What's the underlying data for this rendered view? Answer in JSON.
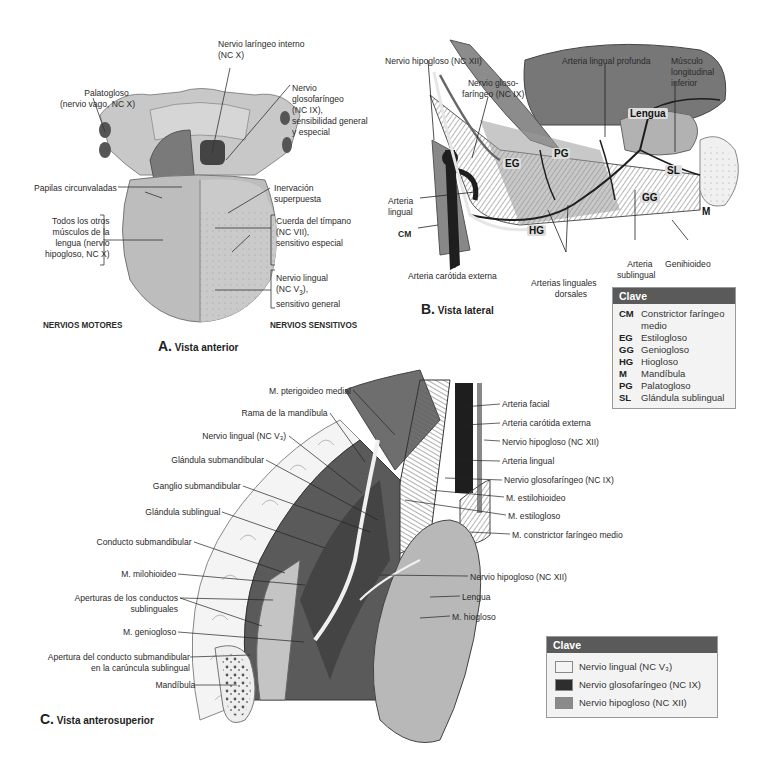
{
  "panel_a": {
    "title_letter": "A.",
    "title_text": "Vista anterior",
    "motor_heading": "NERVIOS MOTORES",
    "sensory_heading": "NERVIOS SENSITIVOS",
    "labels": {
      "palatogloso_1": "Palatogloso",
      "palatogloso_2": "(nervio vago, NC X)",
      "laringeo_1": "Nervio laríngeo interno",
      "laringeo_2": "(NC X)",
      "glosofaringeo_1": "Nervio",
      "glosofaringeo_2": "glosofaríngeo",
      "glosofaringeo_3": "(NC IX),",
      "glosofaringeo_4": "sensibilidad general",
      "glosofaringeo_5": "y especial",
      "papilas": "Papilas circunvaladas",
      "inervacion_1": "Inervación",
      "inervacion_2": "superpuesta",
      "otros_1": "Todos los otros",
      "otros_2": "músculos de la",
      "otros_3": "lengua (nervio",
      "otros_4": "hipogloso, NC X)",
      "cuerda_1": "Cuerda del tímpano",
      "cuerda_2": "(NC VII),",
      "cuerda_3": "sensitivo especial",
      "lingual_1": "Nervio lingual",
      "lingual_2_pre": "(NC V",
      "lingual_2_sub": "3",
      "lingual_2_post": "),",
      "lingual_3": "sensitivo general"
    }
  },
  "panel_b": {
    "title_letter": "B.",
    "title_text": "Vista lateral",
    "labels": {
      "hipogloso": "Nervio hipogloso (NC XII)",
      "glosofaringeo_1": "Nervio gloso-",
      "glosofaringeo_2": "faríngeo (NC IX)",
      "lingual_profunda": "Arteria lingual profunda",
      "longitudinal_1": "Músculo",
      "longitudinal_2": "longitudinal",
      "longitudinal_3": "inferior",
      "arteria_lingual_1": "Arteria",
      "arteria_lingual_2": "lingual",
      "cm": "CM",
      "carotida": "Arteria carótida externa",
      "linguales_dorsales_1": "Arterias linguales",
      "linguales_dorsales_2": "dorsales",
      "sublingual_1": "Arteria",
      "sublingual_2": "sublingual",
      "genihioideo": "Genihioideo"
    },
    "tags": {
      "lengua": "Lengua",
      "eg": "EG",
      "pg": "PG",
      "sl": "SL",
      "gg": "GG",
      "hg": "HG",
      "m": "M"
    },
    "key": {
      "heading": "Clave",
      "items": [
        {
          "abbr": "CM",
          "text": "Constrictor faríngeo",
          "text2": "medio"
        },
        {
          "abbr": "EG",
          "text": "Estilogloso"
        },
        {
          "abbr": "GG",
          "text": "Geniogloso"
        },
        {
          "abbr": "HG",
          "text": "Hiogloso"
        },
        {
          "abbr": "M",
          "text": "Mandíbula"
        },
        {
          "abbr": "PG",
          "text": "Palatogloso"
        },
        {
          "abbr": "SL",
          "text": "Glándula sublingual"
        }
      ]
    }
  },
  "panel_c": {
    "title_letter": "C.",
    "title_text": "Vista anterosuperior",
    "left_labels": [
      "M. pterigoideo medial",
      "Rama de la mandíbula",
      "Nervio lingual (NC V₃)",
      "Glándula submandibular",
      "Ganglio submandibular",
      "Glándula sublingual",
      "Conducto submandibular",
      "M. milohioideo",
      "Aperturas de los conductos",
      "sublinguales",
      "M. geniogloso",
      "Apertura del conducto submandibular",
      "en la carúncula sublingual",
      "Mandíbula"
    ],
    "right_labels": [
      "Arteria facial",
      "Arteria carótida externa",
      "Nervio hipogloso (NC XII)",
      "Arteria lingual",
      "Nervio glosofaríngeo (NC IX)",
      "M. estilohioideo",
      "M. estilogloso",
      "M. constrictor faríngeo medio",
      "Nervio hipogloso (NC XII)",
      "Lengua",
      "M. hiogloso"
    ],
    "key": {
      "heading": "Clave",
      "items": [
        {
          "text": "Nervio lingual (NC V₃)",
          "color": "#f4f4f4"
        },
        {
          "text": "Nervio glosofaríngeo (NC IX)",
          "color": "#2e2e2e"
        },
        {
          "text": "Nervio hipogloso (NC XII)",
          "color": "#8a8a8a"
        }
      ]
    }
  },
  "colors": {
    "key_header": "#5a5a5a",
    "key_bg": "#f3f3f3",
    "tongue": "#bdbdbd",
    "muscle": "#8c8c8c",
    "artery": "#1e1e1e"
  }
}
